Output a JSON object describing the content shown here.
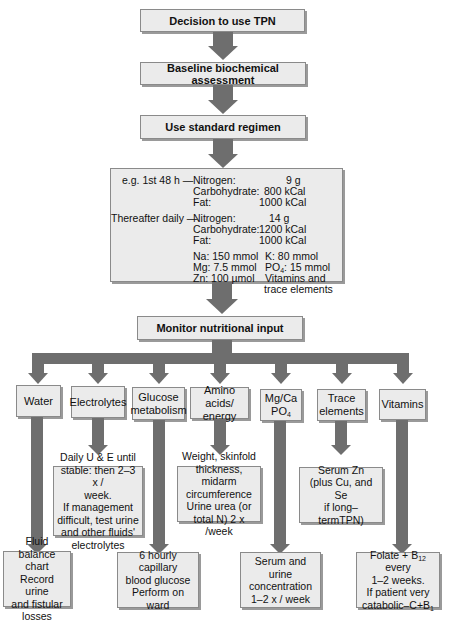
{
  "flow": {
    "step1": "Decision to use TPN",
    "step2": "Baseline biochemical assessment",
    "step3": "Use standard regimen",
    "monitor": "Monitor nutritional input"
  },
  "regimen": {
    "first48_label": "e.g. 1st 48 h —",
    "first48": [
      {
        "name": "Nitrogen:",
        "value": "9 g"
      },
      {
        "name": "Carbohydrate:",
        "value": "800 kCal"
      },
      {
        "name": "Fat:",
        "value": "1000 kCal"
      }
    ],
    "daily_label": "Thereafter daily —",
    "daily": [
      {
        "name": "Nitrogen:",
        "value": "14 g"
      },
      {
        "name": "Carbohydrate:",
        "value": "1200 kCal"
      },
      {
        "name": "Fat:",
        "value": "1000 kCal"
      }
    ],
    "electrolytes_left": [
      "Na: 150 mmol",
      "Mg: 7.5 mmol",
      "Zn: 100 µmol"
    ],
    "electrolytes_right": {
      "k": "K: 80 mmol",
      "po4_prefix": "PO",
      "po4_sub": "4",
      "po4_suffix": ": 15 mmol",
      "vitamins_1": "Vitamins and",
      "vitamins_2": "trace elements"
    }
  },
  "categories": [
    {
      "id": "water",
      "label_1": "Water",
      "label_2": ""
    },
    {
      "id": "electrolytes",
      "label_1": "Electrolytes",
      "label_2": ""
    },
    {
      "id": "glucose",
      "label_1": "Glucose",
      "label_2": "metabolism"
    },
    {
      "id": "amino",
      "label_1": "Amino acids/",
      "label_2": "energy"
    },
    {
      "id": "mgca",
      "label_1": "Mg/Ca",
      "label_2_prefix": "PO",
      "label_2_sub": "4"
    },
    {
      "id": "trace",
      "label_1": "Trace",
      "label_2": "elements"
    },
    {
      "id": "vitamins",
      "label_1": "Vitamins",
      "label_2": ""
    }
  ],
  "mid_results": {
    "electrolytes": [
      "Daily U & E until",
      "stable: then 2–3 x /",
      "week.",
      "If management",
      "difficult, test urine",
      "and other fluids'",
      "electrolytes"
    ],
    "amino": [
      "Weight, skinfold",
      "thickness, midarm",
      "circumference",
      "Urine urea (or",
      "total N) 2 x /week"
    ],
    "trace": [
      "Serum Zn",
      "(plus Cu, and Se",
      "if long–termTPN)"
    ]
  },
  "bottom_results": {
    "water": [
      "Fluid balance",
      "chart",
      "Record urine",
      "and fistular",
      "losses"
    ],
    "glucose": [
      "6 hourly capillary",
      "blood glucose",
      "Perform on ward"
    ],
    "mgca": [
      "Serum and urine",
      "concentration",
      "1–2 x / week"
    ],
    "vitamins": {
      "l1_prefix": "Folate + B",
      "l1_sub": "12",
      "l1_suffix": " every",
      "l2": "1–2 weeks.",
      "l3": "If patient very",
      "l4_prefix": "catabolic–C+B",
      "l4_sub": "1"
    }
  },
  "colors": {
    "box_fill": "#ebebeb",
    "arrow": "#6e6e6e",
    "border": "#8a8a8a"
  }
}
